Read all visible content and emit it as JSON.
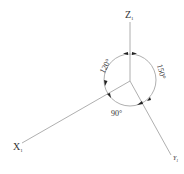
{
  "diagram": {
    "title": "",
    "axes": [
      {
        "id": "z",
        "label": "Z",
        "subscript": "1"
      },
      {
        "id": "x",
        "label": "X",
        "subscript": "1"
      },
      {
        "id": "y",
        "label": "Y",
        "subscript": "1"
      }
    ],
    "angles": [
      {
        "id": "zx",
        "label": "120°"
      },
      {
        "id": "zy",
        "label": "150°"
      },
      {
        "id": "xy",
        "label": "90°"
      }
    ],
    "colors": {
      "line": "#9a9a9a",
      "text": "#333333",
      "arrow": "#222222"
    }
  }
}
